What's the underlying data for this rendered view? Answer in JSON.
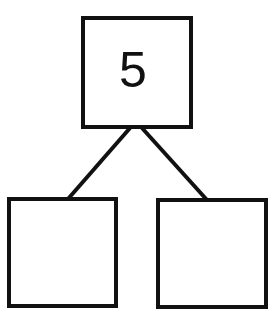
{
  "diagram": {
    "type": "number-bond",
    "colors": {
      "stroke": "#111111",
      "background": "#ffffff"
    },
    "nodes": {
      "whole": {
        "label": "5"
      },
      "part_left": {
        "label": ""
      },
      "part_right": {
        "label": ""
      }
    },
    "edges": [
      {
        "from": "whole",
        "to": "part_left"
      },
      {
        "from": "whole",
        "to": "part_right"
      }
    ]
  }
}
